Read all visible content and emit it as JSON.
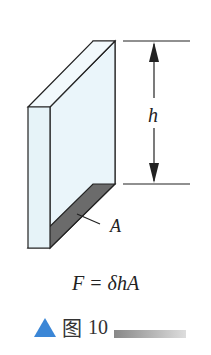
{
  "figure": {
    "height_label": "h",
    "area_label": "A",
    "formula": "F = δhA",
    "caption_icon": "triangle-icon",
    "caption_char": "图",
    "caption_number": "10"
  },
  "colors": {
    "glass": "#e6f3f8",
    "base": "#6b6b6b",
    "triangle": "#3b86d6"
  }
}
